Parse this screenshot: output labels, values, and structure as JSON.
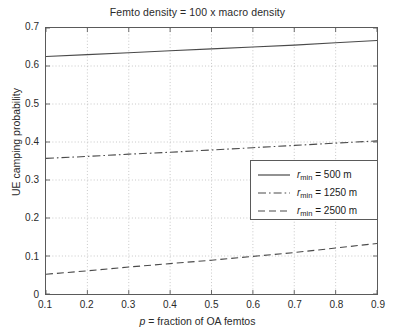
{
  "chart_data": {
    "type": "line",
    "title": "Femto density = 100 x macro density",
    "xlabel": "p = fraction of OA femtos",
    "ylabel": "UE camping probability",
    "xlim": [
      0.1,
      0.9
    ],
    "ylim": [
      0,
      0.7
    ],
    "xticks": [
      "0.1",
      "0.2",
      "0.3",
      "0.4",
      "0.5",
      "0.6",
      "0.7",
      "0.8",
      "0.9"
    ],
    "yticks": [
      "0",
      "0.1",
      "0.2",
      "0.3",
      "0.4",
      "0.5",
      "0.6",
      "0.7"
    ],
    "grid": true,
    "legend_position": "center-right",
    "x": [
      0.1,
      0.2,
      0.3,
      0.4,
      0.5,
      0.6,
      0.7,
      0.8,
      0.9
    ],
    "series": [
      {
        "name": "r_min = 500 m",
        "label_prefix": "r",
        "label_sub": "min",
        "label_suffix": " = 500 m",
        "style": "solid",
        "color": "#4a4a4a",
        "values": [
          0.625,
          0.63,
          0.635,
          0.64,
          0.645,
          0.65,
          0.655,
          0.661,
          0.667
        ]
      },
      {
        "name": "r_min = 1250 m",
        "label_prefix": "r",
        "label_sub": "min",
        "label_suffix": " = 1250 m",
        "style": "dashdot",
        "color": "#4a4a4a",
        "values": [
          0.357,
          0.362,
          0.368,
          0.373,
          0.379,
          0.385,
          0.391,
          0.397,
          0.403
        ]
      },
      {
        "name": "r_min = 2500 m",
        "label_prefix": "r",
        "label_sub": "min",
        "label_suffix": " = 2500 m",
        "style": "dashed",
        "color": "#4a4a4a",
        "values": [
          0.052,
          0.061,
          0.071,
          0.08,
          0.089,
          0.099,
          0.109,
          0.121,
          0.133
        ]
      }
    ]
  }
}
